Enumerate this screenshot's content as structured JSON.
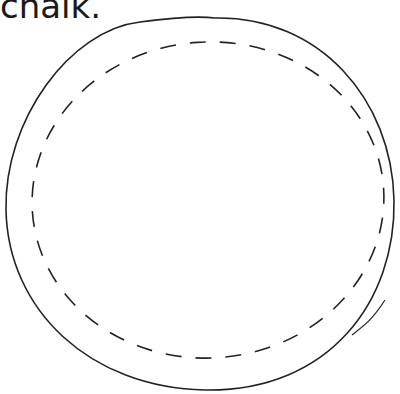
{
  "caption": "chalk.",
  "figure": {
    "outer_circle": {
      "stroke": "#222222",
      "style": "solid"
    },
    "inner_circle": {
      "stroke": "#222222",
      "style": "dashed"
    }
  }
}
